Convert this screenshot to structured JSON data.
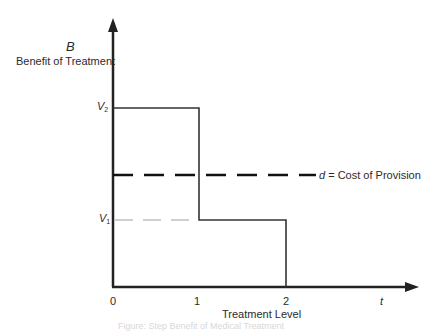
{
  "diagram": {
    "y_axis": {
      "symbol": "B",
      "label": "Benefit of Treatment"
    },
    "x_axis": {
      "symbol": "t",
      "label": "Treatment Level",
      "ticks": [
        "0",
        "1",
        "2"
      ]
    },
    "levels": {
      "v2": {
        "symbol": "V",
        "subscript": "2"
      },
      "v1": {
        "symbol": "V",
        "subscript": "1"
      }
    },
    "cost_line": {
      "symbol": "d",
      "text": " = Cost of Provision"
    },
    "colors": {
      "axis": "#222222",
      "step": "#333333",
      "cost_dash": "#111111",
      "v1_dash": "#d0d0d0"
    },
    "caption": "Figure: Step Benefit of Medical Treatment"
  }
}
